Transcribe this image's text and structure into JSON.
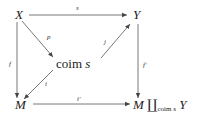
{
  "diagram": {
    "nodes": {
      "X": "X",
      "Y": "Y",
      "coim_prefix": "coim",
      "coim_var": "s",
      "M": "M",
      "pushout_left": "M",
      "pushout_symbol": "∐",
      "pushout_sub": "coim s",
      "pushout_right": "Y"
    },
    "arrows": {
      "s": "s",
      "p": "p",
      "j": "j",
      "f": "f",
      "i": "i",
      "i_prime": "i′",
      "f_prime": "f′"
    }
  }
}
